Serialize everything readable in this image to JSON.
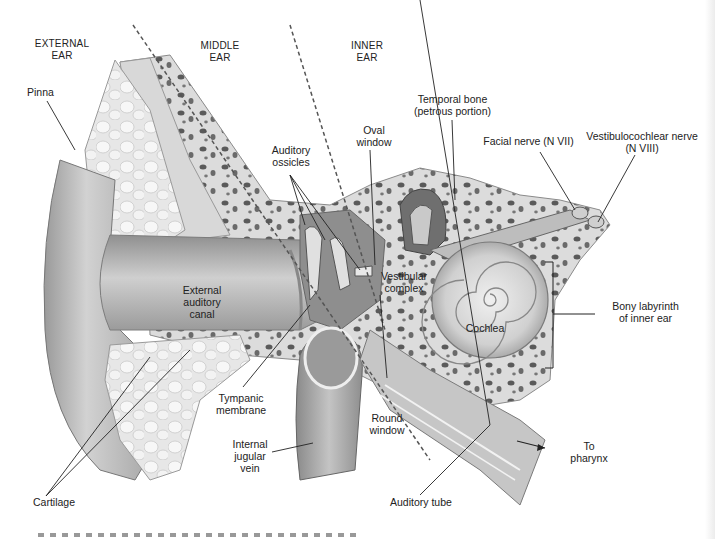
{
  "figure": {
    "colors": {
      "background": "#ffffff",
      "label_text": "#222222",
      "leader_line": "#333333",
      "tissue_light": "#e6e6e6",
      "tissue_mid": "#bdbdbd",
      "tissue_dark": "#7a7a7a",
      "bone_pore": "#555555"
    }
  },
  "regions": {
    "external": "EXTERNAL\nEAR",
    "middle": "MIDDLE\nEAR",
    "inner": "INNER\nEAR"
  },
  "labels": {
    "pinna": "Pinna",
    "auditory_ossicles": "Auditory\nossicles",
    "oval_window": "Oval\nwindow",
    "temporal_bone": "Temporal bone\n(petrous portion)",
    "facial_nerve": "Facial nerve (N VII)",
    "vestibulocochlear_nerve": "Vestibulocochlear nerve\n(N VIII)",
    "external_auditory_canal": "External\nauditory\ncanal",
    "vestibular_complex": "Vestibular\ncomplex",
    "bony_labyrinth": "Bony labyrinth\nof inner ear",
    "cochlea": "Cochlea",
    "tympanic_membrane": "Tympanic\nmembrane",
    "round_window": "Round\nwindow",
    "internal_jugular_vein": "Internal\njugular\nvein",
    "to_pharynx": "To\npharynx",
    "cartilage": "Cartilage",
    "auditory_tube": "Auditory tube"
  }
}
